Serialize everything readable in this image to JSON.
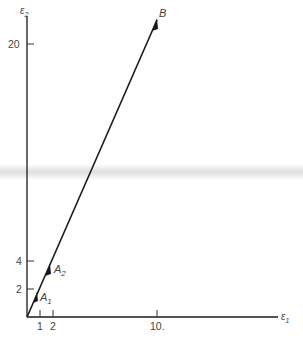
{
  "diagram": {
    "axes": {
      "x_label": "ε",
      "x_label_sub": "1",
      "y_label": "ε",
      "y_label_sub": "2"
    },
    "x_ticks": [
      {
        "value": 1,
        "label": "1"
      },
      {
        "value": 2,
        "label": "2"
      },
      {
        "value": 10,
        "label": "10."
      }
    ],
    "y_ticks": [
      {
        "value": 2,
        "label": "2"
      },
      {
        "value": 4,
        "label": "4"
      },
      {
        "value": 20,
        "label": "20"
      }
    ],
    "points": [
      {
        "name": "A",
        "sub": "1",
        "x": 1,
        "y": 2
      },
      {
        "name": "A",
        "sub": "2",
        "x": 2,
        "y": 4
      },
      {
        "name": "B",
        "sub": "",
        "x": 10,
        "y": 20
      }
    ],
    "colors": {
      "line": "#1a1a1a",
      "text": "#444444",
      "band": "#cfcfcf"
    }
  }
}
